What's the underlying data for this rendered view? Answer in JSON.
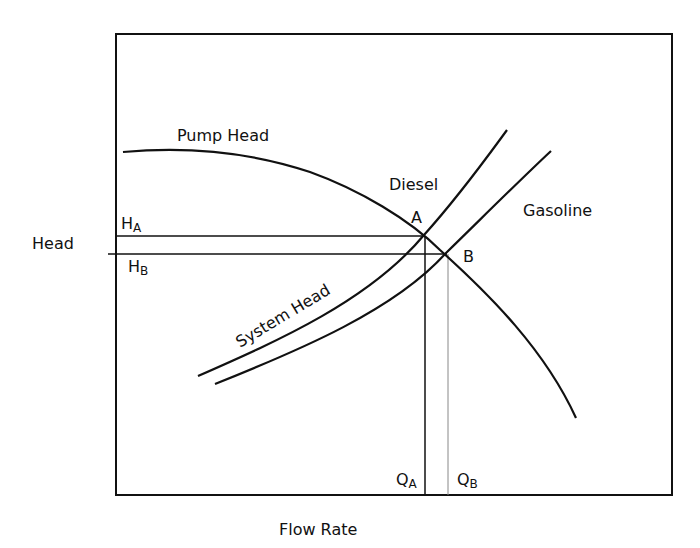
{
  "diagram": {
    "axes": {
      "xlabel": "Flow Rate",
      "ylabel": "Head"
    },
    "curves": {
      "pump": {
        "label": "Pump Head"
      },
      "system": {
        "label": "System Head"
      },
      "diesel": {
        "label": "Diesel"
      },
      "gasoline": {
        "label": "Gasoline"
      }
    },
    "points": {
      "a": {
        "label": "A"
      },
      "b": {
        "label": "B"
      }
    },
    "markers": {
      "ha": {
        "main": "H",
        "sub": "A"
      },
      "hb": {
        "main": "H",
        "sub": "B"
      },
      "qa": {
        "main": "Q",
        "sub": "A"
      },
      "qb": {
        "main": "Q",
        "sub": "B"
      }
    },
    "colors": {
      "line": "#111111",
      "guide_b": "#888888",
      "background": "#ffffff"
    }
  }
}
